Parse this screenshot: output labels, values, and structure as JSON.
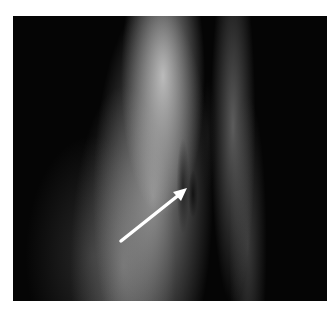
{
  "image": {
    "description": "Grayscale medical/scientific image of a curved tissue band with a white arrow pointing to a dark lesion",
    "arrow": {
      "color": "#ffffff",
      "from": [
        121,
        241
      ],
      "to": [
        186,
        189
      ]
    },
    "colors": {
      "background": "#050505",
      "tissue_bright": "#d2d2d2",
      "page": "#ffffff"
    }
  }
}
